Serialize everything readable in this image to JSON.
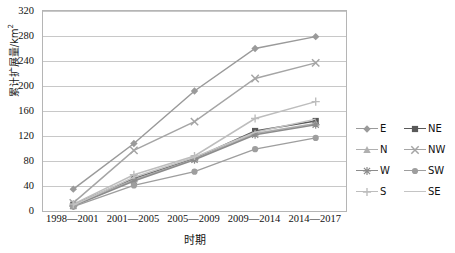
{
  "chart_data": {
    "type": "line",
    "title": "",
    "xlabel": "时期",
    "ylabel": "累计扩展量/km2",
    "ylabel_base": "累计扩展量/km",
    "ylabel_sup": "2",
    "categories": [
      "1998—2001",
      "2001—2005",
      "2005—2009",
      "2009—2014",
      "2014—2017"
    ],
    "ylim": [
      0,
      320
    ],
    "yticks": [
      0,
      40,
      80,
      120,
      160,
      200,
      240,
      280,
      320
    ],
    "grid": true,
    "legend_position": "right",
    "series": [
      {
        "name": "E",
        "color": "#9a9a9a",
        "marker": "diamond",
        "values": [
          35,
          108,
          192,
          260,
          279
        ]
      },
      {
        "name": "NE",
        "color": "#595959",
        "marker": "square",
        "values": [
          10,
          52,
          84,
          128,
          144
        ]
      },
      {
        "name": "N",
        "color": "#b0b0b0",
        "marker": "triangle",
        "values": [
          9,
          50,
          83,
          124,
          140
        ]
      },
      {
        "name": "NW",
        "color": "#a5a5a5",
        "marker": "cross",
        "values": [
          13,
          97,
          143,
          212,
          237
        ]
      },
      {
        "name": "W",
        "color": "#8c8c8c",
        "marker": "star",
        "values": [
          8,
          48,
          82,
          122,
          138
        ]
      },
      {
        "name": "SW",
        "color": "#9e9e9e",
        "marker": "circle",
        "values": [
          7,
          41,
          63,
          99,
          117
        ]
      },
      {
        "name": "S",
        "color": "#bdbdbd",
        "marker": "plus",
        "values": [
          11,
          58,
          88,
          148,
          175
        ]
      },
      {
        "name": "SE",
        "color": "#c4c4c4",
        "marker": "none",
        "values": [
          9,
          54,
          86,
          126,
          147
        ]
      }
    ]
  },
  "legend": {
    "rows": [
      [
        {
          "name": "E"
        },
        {
          "name": "NE"
        }
      ],
      [
        {
          "name": "N"
        },
        {
          "name": "NW"
        }
      ],
      [
        {
          "name": "W"
        },
        {
          "name": "SW"
        }
      ],
      [
        {
          "name": "S"
        },
        {
          "name": "SE"
        }
      ]
    ]
  }
}
